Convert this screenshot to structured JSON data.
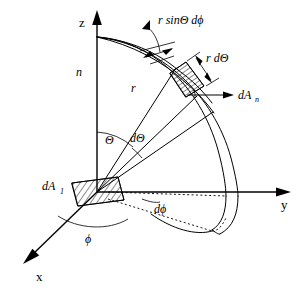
{
  "figure": {
    "background_color": "#ffffff",
    "line_color": "#000000",
    "axes": [
      {
        "id": "z",
        "label": "z",
        "direction": "up"
      },
      {
        "id": "y",
        "label": "y",
        "direction": "right"
      },
      {
        "id": "x",
        "label": "x",
        "direction": "down-left"
      }
    ],
    "labels": {
      "z_axis": "z",
      "y_axis": "y",
      "x_axis": "x",
      "normal": "n",
      "radius": "r",
      "polar_angle": "Θ",
      "azimuth_angle": "ϕ",
      "d_theta": "dΘ",
      "d_phi": "dϕ",
      "arc_width": "r sinΘ dϕ",
      "arc_height": "r dΘ",
      "normal_area_base": "dA",
      "normal_area_sub": "n",
      "source_area_base": "dA",
      "source_area_sub": "1"
    },
    "elements": [
      {
        "name": "source-patch",
        "label": "dA₁",
        "hatched": true
      },
      {
        "name": "surface-patch",
        "label": "r sinΘ dϕ × r dΘ",
        "hatched": true
      },
      {
        "name": "normal-vector",
        "label": "dAₙ"
      },
      {
        "name": "radius-line",
        "label": "r"
      },
      {
        "name": "theta-arc",
        "label": "Θ"
      },
      {
        "name": "dtheta-arc",
        "label": "dΘ"
      },
      {
        "name": "phi-arc",
        "label": "ϕ"
      },
      {
        "name": "dphi-arc",
        "label": "dϕ"
      },
      {
        "name": "hemisphere-meridians",
        "label": "sphere arcs"
      }
    ]
  }
}
